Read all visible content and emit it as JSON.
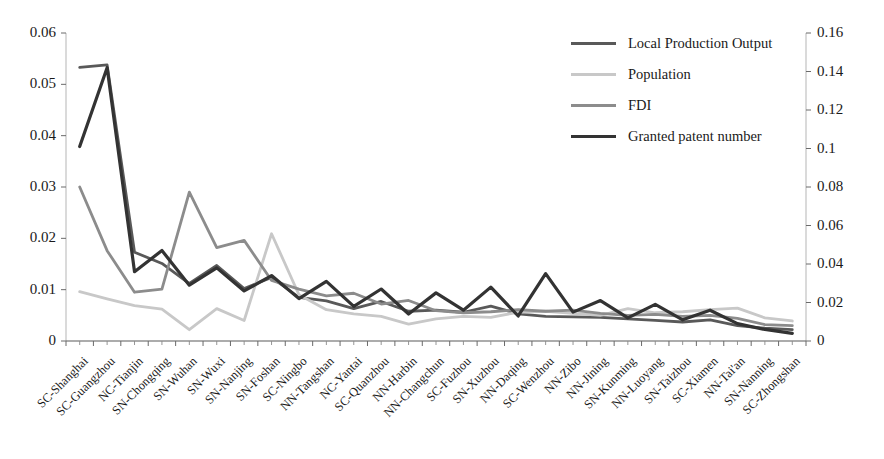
{
  "chart_data": {
    "type": "line",
    "title": "",
    "xlabel": "",
    "ylabel": "",
    "grid": false,
    "legend_position": "top-right",
    "categories": [
      "SC-Shanghai",
      "SC-Guangzhou",
      "NC-Tianjin",
      "SN-Chongqing",
      "SN-Wuhan",
      "SN-Wuxi",
      "SN-Nanjing",
      "SN-Foshan",
      "SC-Ningbo",
      "NN-Tangshan",
      "NC-Yantai",
      "SC-Quanzhou",
      "NN-Harbin",
      "NN-Changchun",
      "SC-Fuzhou",
      "SN-Xuzhou",
      "NN-Daqing",
      "SC-Wenzhou",
      "NN-Zibo",
      "NN-Jining",
      "SN-Kunming",
      "NN-Luoyang",
      "SN-Taizhou",
      "SC-Xiamen",
      "NN-Tai'an",
      "SN-Nanning",
      "SC-Zhongshan"
    ],
    "axes": {
      "left": {
        "ticks": [
          "0",
          "0.01",
          "0.02",
          "0.03",
          "0.04",
          "0.05",
          "0.06"
        ],
        "min": 0,
        "max": 0.06,
        "step": 0.01,
        "applies_to": [
          "Local Production Output",
          "Population",
          "FDI"
        ]
      },
      "right": {
        "ticks": [
          "0",
          "0.02",
          "0.04",
          "0.06",
          "0.08",
          "0.1",
          "0.12",
          "0.14",
          "0.16"
        ],
        "min": 0,
        "max": 0.16,
        "step": 0.02,
        "applies_to": [
          "Granted patent number"
        ]
      }
    },
    "series": [
      {
        "name": "Local Production Output",
        "axis": "left",
        "color": "#595959",
        "values": [
          0.0533,
          0.0538,
          0.0173,
          0.0151,
          0.0112,
          0.0147,
          0.0102,
          0.0124,
          0.0085,
          0.0078,
          0.0063,
          0.0077,
          0.0058,
          0.006,
          0.0056,
          0.0068,
          0.0053,
          0.0048,
          0.0047,
          0.0046,
          0.0043,
          0.004,
          0.0037,
          0.0041,
          0.003,
          0.0025,
          0.0022
        ]
      },
      {
        "name": "Population",
        "axis": "left",
        "color": "#c8c8c8",
        "values": [
          0.0096,
          0.0082,
          0.0069,
          0.0062,
          0.0022,
          0.0063,
          0.004,
          0.0209,
          0.009,
          0.0061,
          0.0053,
          0.0048,
          0.0033,
          0.0043,
          0.0048,
          0.0046,
          0.0056,
          0.0058,
          0.0054,
          0.005,
          0.0063,
          0.0055,
          0.0057,
          0.0061,
          0.0064,
          0.0045,
          0.0039
        ]
      },
      {
        "name": "FDI",
        "axis": "left",
        "color": "#8c8c8c",
        "values": [
          0.03,
          0.0176,
          0.0095,
          0.0101,
          0.029,
          0.0182,
          0.0196,
          0.0118,
          0.0101,
          0.0088,
          0.0093,
          0.0072,
          0.0079,
          0.0059,
          0.0055,
          0.0057,
          0.0061,
          0.0058,
          0.006,
          0.0054,
          0.005,
          0.0052,
          0.0048,
          0.005,
          0.0044,
          0.0032,
          0.003
        ]
      },
      {
        "name": "Granted patent number",
        "axis": "right",
        "color": "#333333",
        "values": [
          0.101,
          0.142,
          0.036,
          0.047,
          0.029,
          0.038,
          0.026,
          0.034,
          0.022,
          0.031,
          0.018,
          0.027,
          0.014,
          0.025,
          0.016,
          0.028,
          0.013,
          0.035,
          0.015,
          0.021,
          0.012,
          0.019,
          0.011,
          0.016,
          0.009,
          0.006,
          0.004
        ]
      }
    ]
  },
  "legend": {
    "items": [
      {
        "label": "Local Production Output",
        "color": "#595959"
      },
      {
        "label": "Population",
        "color": "#c8c8c8"
      },
      {
        "label": "FDI",
        "color": "#8c8c8c"
      },
      {
        "label": "Granted patent number",
        "color": "#333333"
      }
    ]
  }
}
